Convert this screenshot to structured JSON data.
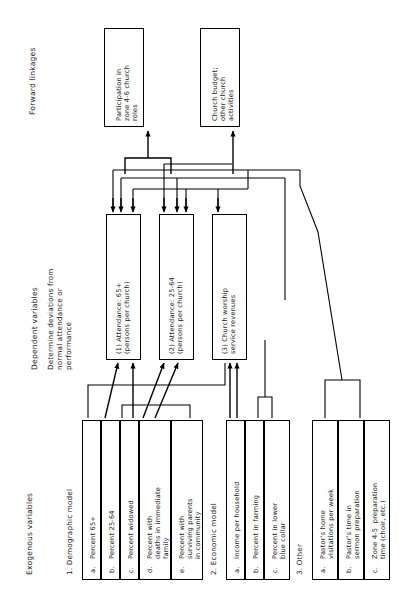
{
  "figure": {
    "type": "flow-diagram",
    "orientation": "rotated-90-ccw",
    "columns": [
      {
        "id": "forward",
        "label": "Forward linkages"
      },
      {
        "id": "dependent",
        "label": "Dependent variables",
        "sublabel": "Determine deviations from\nnormal attendance or\nperformance"
      },
      {
        "id": "exogenous",
        "label": "Exogenous variables"
      }
    ]
  },
  "forward_linkages": [
    {
      "id": "fl1",
      "text": "Participation in\nzone 4-6 church\nroles"
    },
    {
      "id": "fl2",
      "text": "Church budget;\nother church\nactivities"
    }
  ],
  "dependent_variables": [
    {
      "id": "dv1",
      "text": "(1) Attendance: 65+\n(persons per church)"
    },
    {
      "id": "dv2",
      "text": "(2) Attendance: 25-64\n(persons per church)"
    },
    {
      "id": "dv3",
      "text": "(3) Church worship\nservice revenues"
    }
  ],
  "exogenous_groups": [
    {
      "id": "g1",
      "title": "1. Demographic model",
      "items": [
        {
          "key": "a.",
          "text": "Percent 65+"
        },
        {
          "key": "b.",
          "text": "Percent 25-64"
        },
        {
          "key": "c.",
          "text": "Percent widowed"
        },
        {
          "key": "d.",
          "text": "Percent with\ndeaths in immediate\nfamily"
        },
        {
          "key": "e.",
          "text": "Percent with\nsurviving parents\nin community"
        }
      ]
    },
    {
      "id": "g2",
      "title": "2. Economic model",
      "items": [
        {
          "key": "a.",
          "text": "Income per household"
        },
        {
          "key": "b.",
          "text": "Percent in farming"
        },
        {
          "key": "c.",
          "text": "Percent in lower\nblue collar"
        }
      ]
    },
    {
      "id": "g3",
      "title": "3. Other",
      "items": [
        {
          "key": "a.",
          "text": "Pastor's home\nvisitations per week"
        },
        {
          "key": "b.",
          "text": "Pastor's time in\nsermon preparation"
        },
        {
          "key": "c.",
          "text": "Zone 4-5  preparation\ntime (choir, etc.)"
        }
      ]
    }
  ],
  "colors": {
    "ink": "#1a1a1a",
    "line": "#000000",
    "paper": "#ffffff"
  }
}
